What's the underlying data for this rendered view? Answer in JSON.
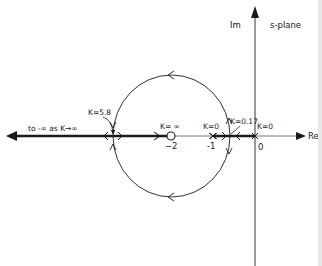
{
  "diagram": {
    "plane_label": "s-plane",
    "axes": {
      "real_label": "Re",
      "imag_label": "Im"
    },
    "points": [
      {
        "id": "pole-0",
        "type": "pole",
        "value": 0,
        "tick_label": "0",
        "k_label": "K=0"
      },
      {
        "id": "pole-minus1",
        "type": "pole",
        "value": -1,
        "tick_label": "-1",
        "k_label": "K=0"
      },
      {
        "id": "zero-minus2",
        "type": "zero",
        "value": -2,
        "tick_label": "−2",
        "k_label": "K= ∞"
      }
    ],
    "breakpoints": [
      {
        "id": "breakaway",
        "label": "K=0.17"
      },
      {
        "id": "break-in",
        "label": "K=5.8"
      }
    ],
    "asymptote_label": "to -∞ as K→∞",
    "colors": {
      "line": "#1a1a1a",
      "background": "#ffffff"
    }
  }
}
